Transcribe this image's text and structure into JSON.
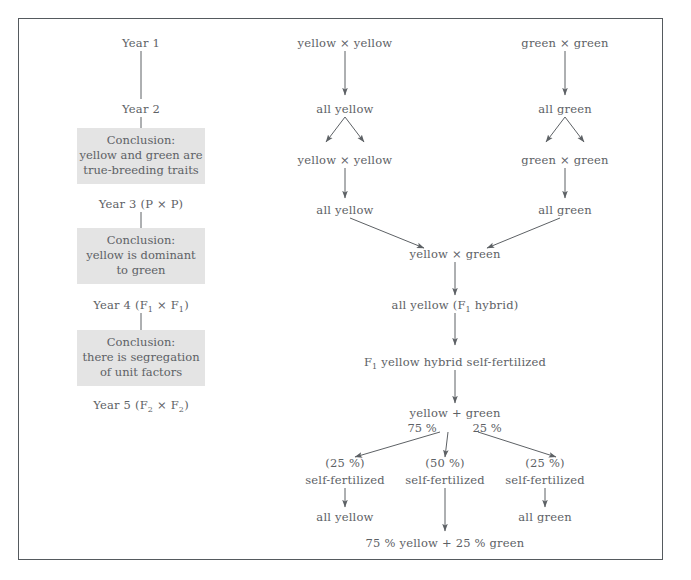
{
  "figure": {
    "border_color": "#555a5e",
    "text_color": "#5d6165",
    "box_fill": "#e4e4e4",
    "background": "#ffffff"
  },
  "timeline": {
    "year1": "Year 1",
    "year2": "Year 2",
    "year3": "Year 3 (P × P)",
    "year4_prefix": "Year 4 (F",
    "year4_sub1": "1",
    "year4_mid": " × F",
    "year4_sub2": "1",
    "year4_suffix": ")",
    "year5_prefix": "Year 5 (F",
    "year5_sub1": "2",
    "year5_mid": " × F",
    "year5_sub2": "2",
    "year5_suffix": ")"
  },
  "conclusions": [
    {
      "title": "Conclusion:",
      "line1": "yellow and green are",
      "line2": "true-breeding traits"
    },
    {
      "title": "Conclusion:",
      "line1": "yellow is dominant",
      "line2": "to green"
    },
    {
      "title": "Conclusion:",
      "line1": "there is segregation",
      "line2": "of unit factors"
    }
  ],
  "yellow_branch": {
    "cross1": "yellow × yellow",
    "offspring1": "all yellow",
    "cross2": "yellow × yellow",
    "offspring2": "all yellow"
  },
  "green_branch": {
    "cross1": "green × green",
    "offspring1": "all green",
    "cross2": "green × green",
    "offspring2": "all green"
  },
  "hybrid": {
    "cross": "yellow × green",
    "f1_prefix": "all yellow (F",
    "f1_sub": "1",
    "f1_suffix": " hybrid)",
    "selfed_prefix": "F",
    "selfed_sub": "1",
    "selfed_suffix": " yellow hybrid self-fertilized"
  },
  "f2": {
    "result": "yellow + green",
    "yellow_pct": "75 %",
    "green_pct": "25 %"
  },
  "f3_columns": [
    {
      "pct": "(25 %)",
      "action": "self-fertilized",
      "result": "all yellow"
    },
    {
      "pct": "(50 %)",
      "action": "self-fertilized",
      "result": ""
    },
    {
      "pct": "(25 %)",
      "action": "self-fertilized",
      "result": "all green"
    }
  ],
  "final_result": "75 % yellow + 25 % green"
}
